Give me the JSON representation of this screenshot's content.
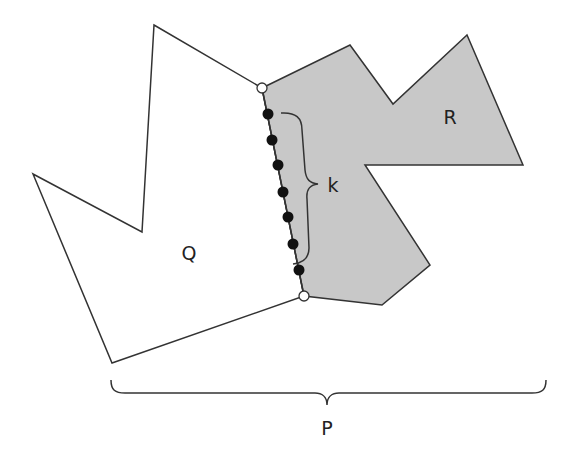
{
  "diagram": {
    "title": "",
    "labels": {
      "Q": "Q",
      "R": "R",
      "k": "k",
      "P": "P"
    },
    "colors": {
      "stroke": "#333333",
      "region_R_fill": "#c8c8c8",
      "region_Q_fill": "#ffffff",
      "dot_fill": "#111111",
      "endpoint_fill": "#ffffff"
    },
    "polygons": {
      "Q": [
        [
          154,
          25
        ],
        [
          262,
          88
        ],
        [
          304,
          296
        ],
        [
          112,
          363
        ],
        [
          33,
          174
        ],
        [
          142,
          232
        ]
      ],
      "R": [
        [
          262,
          88
        ],
        [
          350,
          45
        ],
        [
          393,
          104
        ],
        [
          467,
          35
        ],
        [
          523,
          165
        ],
        [
          365,
          165
        ],
        [
          430,
          265
        ],
        [
          382,
          305
        ],
        [
          304,
          296
        ]
      ]
    },
    "shared_edge_endpoints": [
      [
        262,
        88
      ],
      [
        304,
        296
      ]
    ],
    "shared_edge_points": [
      [
        268,
        114
      ],
      [
        272,
        140
      ],
      [
        278,
        165
      ],
      [
        283,
        192
      ],
      [
        288,
        217
      ],
      [
        293,
        244
      ],
      [
        299,
        270
      ]
    ],
    "k_count_label": "k",
    "braces": [
      {
        "name": "k-brace",
        "label": "k"
      },
      {
        "name": "P-brace",
        "label": "P"
      }
    ]
  }
}
